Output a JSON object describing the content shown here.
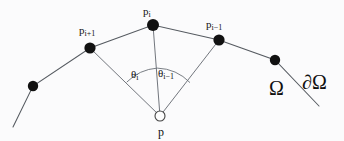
{
  "figure": {
    "background_color": "#fbfbfc",
    "ink_color": "#111111",
    "line_color": "#555a60",
    "width": 344,
    "height": 141
  },
  "labels": {
    "p_i": {
      "base": "p",
      "sub": "i",
      "x": 143,
      "y": 6
    },
    "p_i_plus_1": {
      "base": "p",
      "sub": "i+1",
      "x": 79,
      "y": 25
    },
    "p_i_minus_1": {
      "base": "p",
      "sub": "i−1",
      "x": 206,
      "y": 19
    },
    "theta_i": {
      "base": "θ",
      "sub": "i",
      "x": 131,
      "y": 69
    },
    "theta_i_minus_1": {
      "base": "θ",
      "sub": "i−1",
      "x": 158,
      "y": 68
    },
    "omega": {
      "text": "Ω",
      "x": 269,
      "y": 78
    },
    "boundary_omega": {
      "text": "∂Ω",
      "x": 302,
      "y": 72
    },
    "p": {
      "text": "p",
      "x": 158,
      "y": 126
    }
  },
  "geometry": {
    "boundary_polyline": "13,127 33,86 90,48 153,25 219,40 275,60 319,106",
    "nodes": [
      {
        "name": "node-left-extra",
        "x": 33,
        "y": 86,
        "r": 5.2,
        "kind": "filled"
      },
      {
        "name": "node-p-i-plus-1",
        "x": 90,
        "y": 48,
        "r": 5.6,
        "kind": "filled"
      },
      {
        "name": "node-p-i",
        "x": 153,
        "y": 25,
        "r": 6.0,
        "kind": "filled"
      },
      {
        "name": "node-p-i-minus-1",
        "x": 219,
        "y": 40,
        "r": 5.6,
        "kind": "filled"
      },
      {
        "name": "node-right-extra",
        "x": 275,
        "y": 60,
        "r": 5.2,
        "kind": "filled"
      },
      {
        "name": "node-p",
        "x": 160,
        "y": 116,
        "r": 5.0,
        "kind": "open"
      }
    ],
    "apex": {
      "x": 160,
      "y": 116
    },
    "spokes": [
      {
        "name": "spoke-p-to-p-i-plus-1",
        "x1": 160,
        "y1": 116,
        "x2": 90,
        "y2": 48
      },
      {
        "name": "spoke-p-to-p-i",
        "x1": 160,
        "y1": 116,
        "x2": 153,
        "y2": 25
      },
      {
        "name": "spoke-p-to-p-i-minus-1",
        "x1": 160,
        "y1": 116,
        "x2": 219,
        "y2": 40
      }
    ],
    "arcs": [
      {
        "name": "arc-theta-i",
        "d": "M 126.7 82.2 A 48 48 0 0 1 157.3 68.1"
      },
      {
        "name": "arc-theta-i-minus-1",
        "d": "M 157.3 68.1 A 48 48 0 0 1 190.0 82.6"
      }
    ]
  }
}
